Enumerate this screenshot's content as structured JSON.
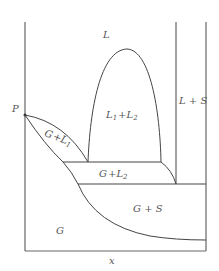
{
  "diagram": {
    "type": "phase-diagram",
    "x_axis_label": "x",
    "point_label": "P",
    "regions": {
      "L": "L",
      "L1_L2": {
        "a": "L",
        "a_sub": "1",
        "plus": "+",
        "b": "L",
        "b_sub": "2"
      },
      "L_S": "L + S",
      "G_L1": {
        "a": "G",
        "plus": "+",
        "b": "L",
        "b_sub": "1"
      },
      "G_L2": {
        "a": "G",
        "plus": "+",
        "b": "L",
        "b_sub": "2"
      },
      "G_S": "G + S",
      "G": "G"
    },
    "colors": {
      "line": "#444444",
      "text": "#555555",
      "background": "#ffffff"
    }
  }
}
